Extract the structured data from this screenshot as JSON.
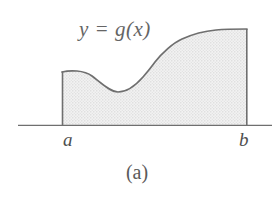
{
  "figure": {
    "caption": "(a)",
    "curve_label": "y = g(x)",
    "left_bound_label": "a",
    "right_bound_label": "b",
    "colors": {
      "background": "#ffffff",
      "fill": "#e9e9e9",
      "fill_dot": "#c9c9c9",
      "curve_stroke": "#6f6f6f",
      "axis_stroke": "#6f6f6f",
      "text": "#5a5a5a"
    }
  },
  "chart_data": {
    "type": "area",
    "title": "y = g(x)",
    "xlabel": "",
    "ylabel": "",
    "annotations": [
      "y = g(x)",
      "a",
      "b",
      "(a)"
    ],
    "grid": false,
    "legend": "none",
    "axis": {
      "x_start_px": 18,
      "x_end_px": 272,
      "baseline_px": 125
    },
    "region": {
      "a_px": 62,
      "b_px": 247,
      "fill": "shaded halftone"
    },
    "curve_points_px": [
      [
        62,
        72
      ],
      [
        78,
        71
      ],
      [
        92,
        76
      ],
      [
        105,
        86
      ],
      [
        118,
        92
      ],
      [
        131,
        89
      ],
      [
        143,
        77
      ],
      [
        155,
        62
      ],
      [
        168,
        48
      ],
      [
        182,
        39
      ],
      [
        198,
        33
      ],
      [
        216,
        30
      ],
      [
        232,
        29
      ],
      [
        247,
        29
      ]
    ],
    "path_d": "M62,72 C70,70 84,70 92,76 C100,82 110,92 118,92 C127,92 136,85 143,77 C150,69 149,70 155,62 C162,53 173,43 182,39 C193,34 205,31 216,30 C226,29 239,29 247,29"
  }
}
